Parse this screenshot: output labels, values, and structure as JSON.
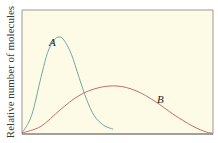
{
  "chart_data": {
    "type": "line",
    "title": "",
    "xlabel": "",
    "ylabel": "Relative number of molecules",
    "grid": false,
    "legend": "inline labels",
    "axis_ticks": "none",
    "series": [
      {
        "name": "A",
        "color": "#6fa9a8",
        "shape": "narrow tall peak, left",
        "points": [
          [
            0,
            0
          ],
          [
            0.05,
            0.18
          ],
          [
            0.1,
            0.58
          ],
          [
            0.135,
            0.84
          ],
          [
            0.17,
            0.97
          ],
          [
            0.195,
            1.0
          ],
          [
            0.22,
            0.97
          ],
          [
            0.26,
            0.82
          ],
          [
            0.3,
            0.58
          ],
          [
            0.34,
            0.35
          ],
          [
            0.38,
            0.18
          ],
          [
            0.43,
            0.08
          ],
          [
            0.48,
            0.04
          ]
        ]
      },
      {
        "name": "B",
        "color": "#c86a6e",
        "shape": "broad low peak, right",
        "points": [
          [
            0,
            0
          ],
          [
            0.1,
            0.07
          ],
          [
            0.2,
            0.24
          ],
          [
            0.3,
            0.39
          ],
          [
            0.4,
            0.47
          ],
          [
            0.5,
            0.49
          ],
          [
            0.6,
            0.44
          ],
          [
            0.7,
            0.33
          ],
          [
            0.8,
            0.19
          ],
          [
            0.9,
            0.07
          ],
          [
            0.97,
            0.01
          ],
          [
            1,
            0
          ]
        ]
      }
    ]
  },
  "labels": {
    "ylabel": "Relative number of molecules",
    "series_a": "A",
    "series_b": "B"
  },
  "colors": {
    "plot_bg": "#fdfbe6",
    "frame": "#555555",
    "curve_a": "#6fa9a8",
    "curve_b": "#c86a6e"
  }
}
